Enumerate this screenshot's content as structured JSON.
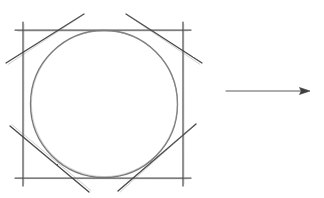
{
  "figure": {
    "style": "hand-drawn pencil sketch",
    "background_color": "#ffffff",
    "canvas": {
      "width": 324,
      "height": 198
    }
  },
  "colors": {
    "pencil_dark": "#3a3a3a",
    "pencil_medium": "#5a5a5a",
    "pencil_light": "#8c8c8c",
    "arrow": "#4a4a4a",
    "background": "#ffffff"
  },
  "chart_data": {
    "type": "diagram",
    "elements": [
      {
        "name": "square",
        "kind": "rectangle",
        "x_left": 23,
        "x_right": 183,
        "y_top": 30,
        "y_bottom": 178,
        "width": 160,
        "height": 148,
        "stroke": "#4a4a4a",
        "overshoot_px": 8,
        "note": "edges drawn past the corners as in a freehand construction"
      },
      {
        "name": "inscribed-circle",
        "kind": "circle",
        "cx": 104,
        "cy": 104,
        "r": 79,
        "stroke": "#6a6a6a",
        "note": "tangent to all four square edges"
      },
      {
        "name": "chamfer-top-left",
        "kind": "line",
        "x1": 6,
        "y1": 63,
        "x2": 84,
        "y2": 14,
        "stroke": "#3f3f3f",
        "note": "tangent to circle at 135 degrees, cuts the top-left corner"
      },
      {
        "name": "chamfer-top-right",
        "kind": "line",
        "x1": 126,
        "y1": 14,
        "x2": 202,
        "y2": 63,
        "stroke": "#3f3f3f",
        "note": "tangent to circle at 45 degrees, cuts the top-right corner"
      },
      {
        "name": "chamfer-bottom-left",
        "kind": "line",
        "x1": 10,
        "y1": 126,
        "x2": 89,
        "y2": 192,
        "stroke": "#3f3f3f",
        "note": "tangent to circle at 225 degrees, cuts the bottom-left corner"
      },
      {
        "name": "chamfer-bottom-right",
        "kind": "line",
        "x1": 118,
        "y1": 191,
        "x2": 196,
        "y2": 124,
        "stroke": "#3f3f3f",
        "note": "tangent to circle at 315 degrees, cuts the bottom-right corner"
      },
      {
        "name": "transformation-arrow",
        "kind": "arrow",
        "x1": 226,
        "y1": 91,
        "x2": 310,
        "y2": 91,
        "direction": "right",
        "stroke": "#4a4a4a",
        "head_length": 9,
        "head_width": 7
      }
    ],
    "xlim": [
      0,
      324
    ],
    "ylim": [
      0,
      198
    ],
    "grid": false,
    "legend": null
  }
}
